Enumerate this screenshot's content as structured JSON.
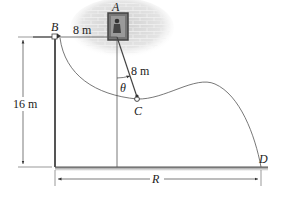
{
  "diagram": {
    "points": {
      "A": "A",
      "B": "B",
      "C": "C",
      "D": "D"
    },
    "dimensions": {
      "ab_length": "8 m",
      "ac_length": "8 m",
      "height": "16 m",
      "range": "R",
      "angle": "θ"
    },
    "colors": {
      "line": "#333333",
      "wall": "#c8c8c8",
      "frame": "#555555",
      "ground": "#666666"
    }
  }
}
